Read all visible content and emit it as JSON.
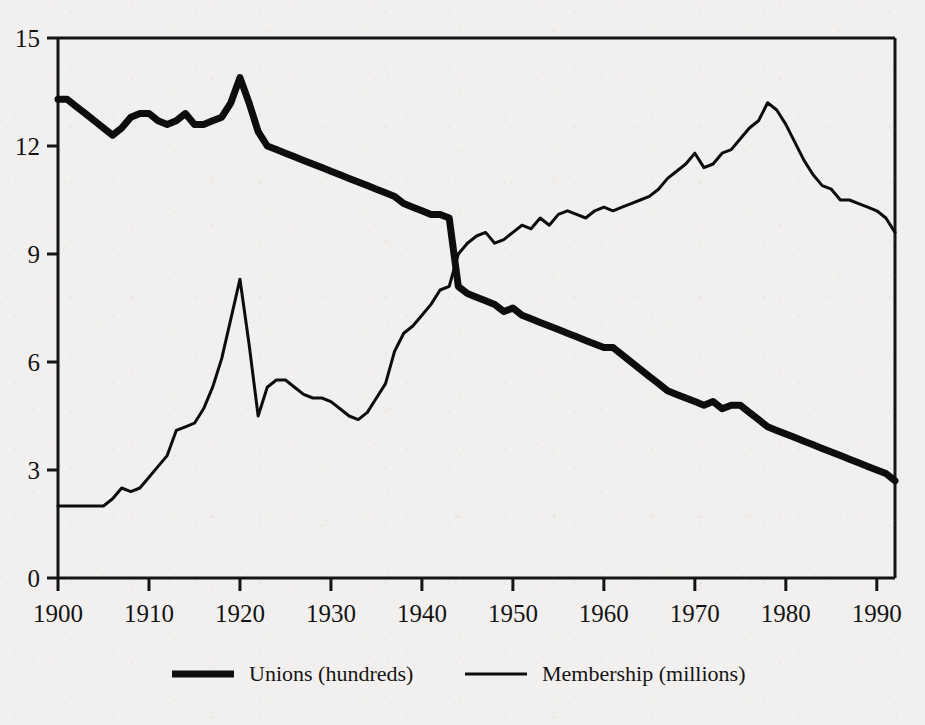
{
  "chart_data": {
    "type": "line",
    "title": "",
    "subtitle": "",
    "xlabel": "",
    "ylabel": "",
    "xlim": [
      1900,
      1992
    ],
    "ylim": [
      0,
      15
    ],
    "grid": false,
    "legend_position": "bottom",
    "x_ticks": [
      1900,
      1910,
      1920,
      1930,
      1940,
      1950,
      1960,
      1970,
      1980,
      1990
    ],
    "x_tick_labels": [
      "1900",
      "1910",
      "1920",
      "1930",
      "1940",
      "1950",
      "1960",
      "1970",
      "1980",
      "1990"
    ],
    "y_ticks": [
      0,
      3,
      6,
      9,
      12,
      15
    ],
    "y_tick_labels": [
      "0",
      "3",
      "6",
      "9",
      "12",
      "15"
    ],
    "series": [
      {
        "name": "Unions (hundreds)",
        "legend_label": "Unions (hundreds)",
        "line_style": "thick",
        "line_width": 7,
        "color": "#0d0d0d",
        "x": [
          1900,
          1901,
          1902,
          1903,
          1904,
          1905,
          1906,
          1907,
          1908,
          1909,
          1910,
          1911,
          1912,
          1913,
          1914,
          1915,
          1916,
          1917,
          1918,
          1919,
          1920,
          1921,
          1922,
          1923,
          1924,
          1925,
          1926,
          1927,
          1928,
          1929,
          1930,
          1931,
          1932,
          1933,
          1934,
          1935,
          1936,
          1937,
          1938,
          1939,
          1940,
          1941,
          1942,
          1943,
          1944,
          1945,
          1946,
          1947,
          1948,
          1949,
          1950,
          1951,
          1952,
          1953,
          1954,
          1955,
          1956,
          1957,
          1958,
          1959,
          1960,
          1961,
          1962,
          1963,
          1964,
          1965,
          1966,
          1967,
          1968,
          1969,
          1970,
          1971,
          1972,
          1973,
          1974,
          1975,
          1976,
          1977,
          1978,
          1979,
          1980,
          1981,
          1982,
          1983,
          1984,
          1985,
          1986,
          1987,
          1988,
          1989,
          1990,
          1991,
          1992
        ],
        "y": [
          13.3,
          13.3,
          13.1,
          12.9,
          12.7,
          12.5,
          12.3,
          12.5,
          12.8,
          12.9,
          12.9,
          12.7,
          12.6,
          12.7,
          12.9,
          12.6,
          12.6,
          12.7,
          12.8,
          13.2,
          13.9,
          13.2,
          12.4,
          12.0,
          11.9,
          11.8,
          11.7,
          11.6,
          11.5,
          11.4,
          11.3,
          11.2,
          11.1,
          11.0,
          10.9,
          10.8,
          10.7,
          10.6,
          10.4,
          10.3,
          10.2,
          10.1,
          10.1,
          10.0,
          8.1,
          7.9,
          7.8,
          7.7,
          7.6,
          7.4,
          7.5,
          7.3,
          7.2,
          7.1,
          7.0,
          6.9,
          6.8,
          6.7,
          6.6,
          6.5,
          6.4,
          6.4,
          6.2,
          6.0,
          5.8,
          5.6,
          5.4,
          5.2,
          5.1,
          5.0,
          4.9,
          4.8,
          4.9,
          4.7,
          4.8,
          4.8,
          4.6,
          4.4,
          4.2,
          4.1,
          4.0,
          3.9,
          3.8,
          3.7,
          3.6,
          3.5,
          3.4,
          3.3,
          3.2,
          3.1,
          3.0,
          2.9,
          2.7
        ]
      },
      {
        "name": "Membership (millions)",
        "legend_label": "Membership (millions)",
        "line_style": "thin",
        "line_width": 3,
        "color": "#0d0d0d",
        "x": [
          1900,
          1901,
          1902,
          1903,
          1904,
          1905,
          1906,
          1907,
          1908,
          1909,
          1910,
          1911,
          1912,
          1913,
          1914,
          1915,
          1916,
          1917,
          1918,
          1919,
          1920,
          1921,
          1922,
          1923,
          1924,
          1925,
          1926,
          1927,
          1928,
          1929,
          1930,
          1931,
          1932,
          1933,
          1934,
          1935,
          1936,
          1937,
          1938,
          1939,
          1940,
          1941,
          1942,
          1943,
          1944,
          1945,
          1946,
          1947,
          1948,
          1949,
          1950,
          1951,
          1952,
          1953,
          1954,
          1955,
          1956,
          1957,
          1958,
          1959,
          1960,
          1961,
          1962,
          1963,
          1964,
          1965,
          1966,
          1967,
          1968,
          1969,
          1970,
          1971,
          1972,
          1973,
          1974,
          1975,
          1976,
          1977,
          1978,
          1979,
          1980,
          1981,
          1982,
          1983,
          1984,
          1985,
          1986,
          1987,
          1988,
          1989,
          1990,
          1991,
          1992
        ],
        "y": [
          2.0,
          2.0,
          2.0,
          2.0,
          2.0,
          2.0,
          2.2,
          2.5,
          2.4,
          2.5,
          2.8,
          3.1,
          3.4,
          4.1,
          4.2,
          4.3,
          4.7,
          5.3,
          6.1,
          7.2,
          8.3,
          6.5,
          4.5,
          5.3,
          5.5,
          5.5,
          5.3,
          5.1,
          5.0,
          5.0,
          4.9,
          4.7,
          4.5,
          4.4,
          4.6,
          5.0,
          5.4,
          6.3,
          6.8,
          7.0,
          7.3,
          7.6,
          8.0,
          8.1,
          9.0,
          9.3,
          9.5,
          9.6,
          9.3,
          9.4,
          9.6,
          9.8,
          9.7,
          10.0,
          9.8,
          10.1,
          10.2,
          10.1,
          10.0,
          10.2,
          10.3,
          10.2,
          10.3,
          10.4,
          10.5,
          10.6,
          10.8,
          11.1,
          11.3,
          11.5,
          11.8,
          11.4,
          11.5,
          11.8,
          11.9,
          12.2,
          12.5,
          12.7,
          13.2,
          13.0,
          12.6,
          12.1,
          11.6,
          11.2,
          10.9,
          10.8,
          10.5,
          10.5,
          10.4,
          10.3,
          10.2,
          10.0,
          9.6
        ]
      }
    ]
  },
  "axes": {
    "left_label": "",
    "bottom_label": ""
  }
}
